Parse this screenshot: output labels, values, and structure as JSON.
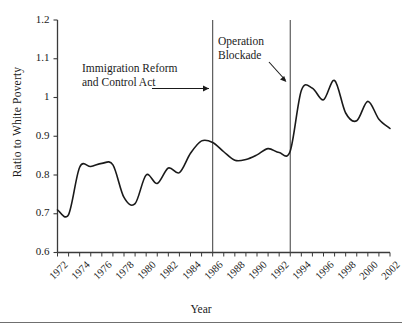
{
  "chart_data": {
    "type": "line",
    "title": "",
    "xlabel": "Year",
    "ylabel": "Ratio to White Poverty",
    "xlim": [
      1972,
      2002
    ],
    "ylim": [
      0.6,
      1.2
    ],
    "ytick_labels": [
      "0.6",
      "0.7",
      "0.8",
      "0.9",
      "1",
      "1.1",
      "1.2"
    ],
    "ytick_values": [
      0.6,
      0.7,
      0.8,
      0.9,
      1.0,
      1.1,
      1.2
    ],
    "xtick_labels": [
      "1972",
      "1974",
      "1976",
      "1978",
      "1980",
      "1982",
      "1984",
      "1986",
      "1988",
      "1990",
      "1992",
      "1994",
      "1996",
      "1998",
      "2000",
      "2002"
    ],
    "xtick_values": [
      1972,
      1974,
      1976,
      1978,
      1980,
      1982,
      1984,
      1986,
      1988,
      1990,
      1992,
      1994,
      1996,
      1998,
      2000,
      2002
    ],
    "xminor_step": 1,
    "grid": false,
    "legend": false,
    "line_color": "#1a1a1a",
    "line_width": 1.6,
    "x": [
      1972,
      1973,
      1974,
      1975,
      1976,
      1977,
      1978,
      1979,
      1980,
      1981,
      1982,
      1983,
      1984,
      1985,
      1986,
      1987,
      1988,
      1989,
      1990,
      1991,
      1992,
      1993,
      1994,
      1995,
      1996,
      1997,
      1998,
      1999,
      2000,
      2001,
      2002
    ],
    "values": [
      0.71,
      0.698,
      0.82,
      0.822,
      0.83,
      0.826,
      0.742,
      0.726,
      0.8,
      0.778,
      0.818,
      0.806,
      0.856,
      0.888,
      0.884,
      0.86,
      0.838,
      0.84,
      0.852,
      0.868,
      0.858,
      0.862,
      1.018,
      1.024,
      0.994,
      1.044,
      0.96,
      0.94,
      0.99,
      0.944,
      0.92
    ],
    "series": [
      {
        "name": "Ratio to White Poverty",
        "values": [
          0.71,
          0.698,
          0.82,
          0.822,
          0.83,
          0.826,
          0.742,
          0.726,
          0.8,
          0.778,
          0.818,
          0.806,
          0.856,
          0.888,
          0.884,
          0.86,
          0.838,
          0.84,
          0.852,
          0.868,
          0.858,
          0.862,
          1.018,
          1.024,
          0.994,
          1.044,
          0.96,
          0.94,
          0.99,
          0.944,
          0.92
        ]
      }
    ],
    "vlines": [
      {
        "name": "immigration-reform-and-control-act",
        "x": 1986,
        "color": "#4d4d4d"
      },
      {
        "name": "operation-blockade",
        "x": 1993,
        "color": "#4d4d4d"
      }
    ],
    "annotations": [
      {
        "name": "immigration-reform-and-control-act",
        "line1": "Immigration Reform",
        "line2": "and Control Act",
        "arrow": "horizontal-right",
        "target_x": 1986
      },
      {
        "name": "operation-blockade",
        "line1": "Operation",
        "line2": "Blockade",
        "arrow": "diagonal-down-right",
        "target_x": 1993
      }
    ]
  }
}
